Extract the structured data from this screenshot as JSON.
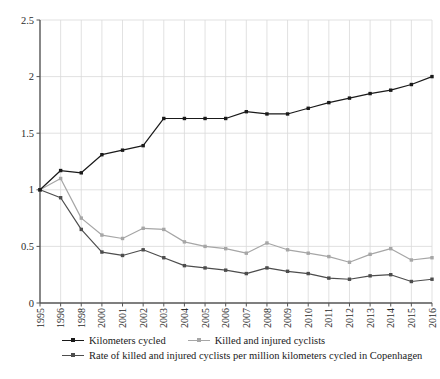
{
  "chart_data": {
    "type": "line",
    "title": "",
    "subtitle": "",
    "xlabel": "",
    "ylabel": "",
    "ylim": [
      0,
      2.5
    ],
    "ytick_labels": [
      "0",
      "0.5",
      "1",
      "1.5",
      "2",
      "2.5"
    ],
    "ytick_values": [
      0,
      0.5,
      1,
      1.5,
      2,
      2.5
    ],
    "grid": true,
    "grid_x": true,
    "grid_y": true,
    "legend_position": "below",
    "categories": [
      "1995",
      "1996",
      "1998",
      "2000",
      "2001",
      "2002",
      "2003",
      "2004",
      "2005",
      "2006",
      "2007",
      "2008",
      "2009",
      "2010",
      "2011",
      "2012",
      "2013",
      "2014",
      "2015",
      "2016"
    ],
    "series": [
      {
        "name": "Kilometers cycled",
        "color": "#1a1a1a",
        "marker": "circle",
        "values": [
          1.0,
          1.17,
          1.15,
          1.31,
          1.35,
          1.39,
          1.63,
          1.63,
          1.63,
          1.63,
          1.69,
          1.67,
          1.67,
          1.72,
          1.77,
          1.81,
          1.85,
          1.88,
          1.93,
          2.0
        ]
      },
      {
        "name": "Killed and injured cyclists",
        "color": "#a6a6a6",
        "marker": "circle",
        "values": [
          1.0,
          1.1,
          0.75,
          0.6,
          0.57,
          0.66,
          0.65,
          0.54,
          0.5,
          0.48,
          0.44,
          0.53,
          0.47,
          0.44,
          0.41,
          0.36,
          0.43,
          0.48,
          0.38,
          0.4
        ]
      },
      {
        "name": "Rate of killed and injured cyclists per million kilometers cycled in Copenhagen",
        "color": "#4d4d4d",
        "marker": "circle",
        "values": [
          1.0,
          0.93,
          0.65,
          0.45,
          0.42,
          0.47,
          0.4,
          0.33,
          0.31,
          0.29,
          0.26,
          0.31,
          0.28,
          0.26,
          0.22,
          0.21,
          0.24,
          0.25,
          0.19,
          0.21
        ]
      }
    ]
  },
  "legend": {
    "entries": [
      {
        "label": "Kilometers cycled",
        "color": "#1a1a1a"
      },
      {
        "label": "Killed and injured cyclists",
        "color": "#a6a6a6"
      },
      {
        "label": "Rate of killed and injured cyclists per million kilometers cycled in Copenhagen",
        "color": "#4d4d4d"
      }
    ]
  },
  "axes": {
    "y_axis_color": "#555555",
    "x_axis_color": "#555555",
    "grid_color": "#d9d9d9"
  }
}
